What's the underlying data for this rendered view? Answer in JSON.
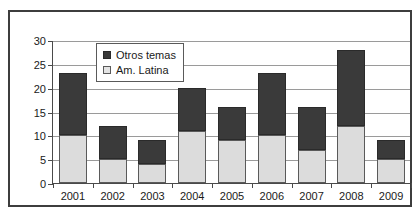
{
  "chart_data": {
    "type": "bar",
    "stacked": true,
    "title": "",
    "subtitle": "",
    "xlabel": "",
    "ylabel": "",
    "categories": [
      "2001",
      "2002",
      "2003",
      "2004",
      "2005",
      "2006",
      "2007",
      "2008",
      "2009"
    ],
    "series": [
      {
        "name": "Am. Latina",
        "color": "#dcdcdc",
        "values": [
          10,
          5,
          4,
          11,
          9,
          10,
          7,
          12,
          5
        ]
      },
      {
        "name": "Otros temas",
        "color": "#3a3a3a",
        "values": [
          13,
          7,
          5,
          9,
          7,
          13,
          9,
          16,
          4
        ]
      }
    ],
    "totals": [
      23,
      12,
      9,
      20,
      16,
      23,
      16,
      28,
      9
    ],
    "ylim": [
      0,
      30
    ],
    "yticks": [
      0,
      5,
      10,
      15,
      20,
      25,
      30
    ],
    "ytick_labels": [
      "0",
      "5",
      "10",
      "15",
      "20",
      "25",
      "30"
    ],
    "grid": true,
    "legend_position": "top-center",
    "legend_entries": [
      "Otros temas",
      "Am. Latina"
    ]
  }
}
